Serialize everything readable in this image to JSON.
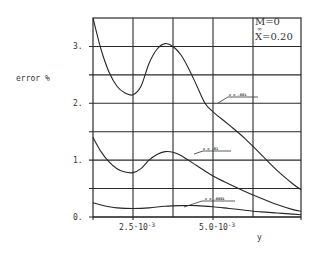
{
  "chart_data": {
    "type": "line",
    "title": "",
    "xlabel": "y",
    "ylabel": "error %",
    "xlim": [
      0.00125,
      0.00775
    ],
    "ylim": [
      0,
      3.5
    ],
    "grid": true,
    "x_ticks": [
      {
        "value": 0.0025,
        "label": "2.5·10",
        "exp": "-3"
      },
      {
        "value": 0.005,
        "label": "5.0·10",
        "exp": "-3"
      }
    ],
    "y_ticks": [
      {
        "value": 0,
        "label": "0."
      },
      {
        "value": 1,
        "label": "1."
      },
      {
        "value": 2,
        "label": "2."
      },
      {
        "value": 3,
        "label": "3."
      }
    ],
    "x_gridlines": [
      0.0025,
      0.00375,
      0.005,
      0.00625
    ],
    "y_gridlines": [
      0.5,
      1,
      1.5,
      2,
      2.5,
      3
    ],
    "annotation": {
      "line1": "M=0",
      "sub": "∞",
      "line2": "X=0.20"
    },
    "series": [
      {
        "name": "ε = .001",
        "x": [
          0.00125,
          0.0015,
          0.00175,
          0.002,
          0.00225,
          0.0025,
          0.00275,
          0.003,
          0.00325,
          0.0035,
          0.00375,
          0.004,
          0.00425,
          0.0045,
          0.00475,
          0.005,
          0.0055,
          0.006,
          0.0065,
          0.007,
          0.0075,
          0.00775
        ],
        "y": [
          3.5,
          2.95,
          2.55,
          2.3,
          2.18,
          2.15,
          2.3,
          2.7,
          2.95,
          3.05,
          3.0,
          2.85,
          2.6,
          2.3,
          2.0,
          1.85,
          1.62,
          1.38,
          1.1,
          0.82,
          0.58,
          0.48
        ]
      },
      {
        "name": "ε = .01",
        "x": [
          0.00125,
          0.0015,
          0.00175,
          0.002,
          0.00225,
          0.0025,
          0.00275,
          0.003,
          0.00325,
          0.0035,
          0.00375,
          0.004,
          0.0045,
          0.005,
          0.0055,
          0.006,
          0.0065,
          0.007,
          0.0075,
          0.00775
        ],
        "y": [
          1.4,
          1.15,
          0.97,
          0.85,
          0.79,
          0.78,
          0.85,
          1.0,
          1.1,
          1.15,
          1.14,
          1.08,
          0.9,
          0.72,
          0.58,
          0.45,
          0.33,
          0.22,
          0.13,
          0.1
        ]
      },
      {
        "name": "ε = .0001",
        "x": [
          0.00125,
          0.0015,
          0.00175,
          0.002,
          0.0025,
          0.003,
          0.0035,
          0.004,
          0.0045,
          0.005,
          0.0055,
          0.006,
          0.0065,
          0.007,
          0.0075,
          0.00775
        ],
        "y": [
          0.25,
          0.21,
          0.18,
          0.16,
          0.15,
          0.16,
          0.19,
          0.2,
          0.2,
          0.18,
          0.15,
          0.12,
          0.09,
          0.07,
          0.05,
          0.04
        ]
      }
    ],
    "curve_labels": [
      {
        "series": 0,
        "text": "ε = .001"
      },
      {
        "series": 1,
        "text": "ε = .01"
      },
      {
        "series": 2,
        "text": "ε = .0001"
      }
    ]
  }
}
